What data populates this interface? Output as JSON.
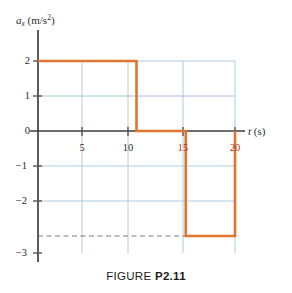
{
  "figure": {
    "caption_prefix": "FIGURE ",
    "caption_id": "P2.11"
  },
  "axis_labels": {
    "y_symbol": "a",
    "y_subscript": "x",
    "y_units_open": " (m/s",
    "y_units_exp": "2",
    "y_units_close": ")",
    "x_symbol": "t",
    "x_units": " (s)"
  },
  "ticks": {
    "y": [
      "2",
      "1",
      "0",
      "−1",
      "−2",
      "−3"
    ],
    "x": [
      "5",
      "10",
      "15",
      "20"
    ]
  },
  "colors": {
    "curve": "#e0762f",
    "grid": "#9dc3e6",
    "grid_alt": "#8fd6d2",
    "axis": "#4d4d4d",
    "dashed": "#7a7a7a",
    "tick_highlight": "#b03a1a",
    "background": "#ffffff"
  },
  "chart_data": {
    "type": "line",
    "title": "FIGURE P2.11",
    "xlabel": "t (s)",
    "ylabel": "a_x (m/s^2)",
    "xlim": [
      0,
      22
    ],
    "ylim": [
      -3.6,
      2.9
    ],
    "xticks": [
      5,
      10,
      15,
      20
    ],
    "yticks": [
      2,
      1,
      0,
      -1,
      -2,
      -3
    ],
    "grid": true,
    "legend": "none",
    "series": [
      {
        "name": "a_x",
        "style": "step",
        "color": "#e0762f",
        "x": [
          0,
          10,
          10,
          15,
          15,
          20,
          20
        ],
        "y": [
          2,
          2,
          0,
          0,
          -3,
          -3,
          0
        ],
        "segments": [
          {
            "t_start": 0,
            "t_end": 10,
            "a": 2
          },
          {
            "t_start": 10,
            "t_end": 15,
            "a": 0
          },
          {
            "t_start": 15,
            "t_end": 20,
            "a": -3
          }
        ]
      }
    ],
    "annotations": [
      {
        "type": "dashed-hline",
        "y": -3,
        "x_start": 0,
        "x_end": 15,
        "color": "#7a7a7a"
      }
    ]
  }
}
